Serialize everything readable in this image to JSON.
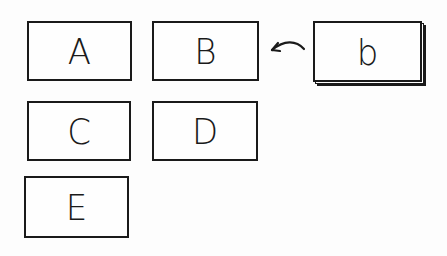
{
  "diagram": {
    "boxes": [
      {
        "id": "A",
        "label": "A"
      },
      {
        "id": "B",
        "label": "B"
      },
      {
        "id": "b",
        "label": "b",
        "stacked": true
      },
      {
        "id": "C",
        "label": "C"
      },
      {
        "id": "D",
        "label": "D"
      },
      {
        "id": "E",
        "label": "E"
      }
    ],
    "arrows": [
      {
        "from": "b",
        "to": "B",
        "style": "curved"
      }
    ],
    "colors": {
      "stroke": "#1a1a1a",
      "background": "#fdfdfd"
    }
  }
}
